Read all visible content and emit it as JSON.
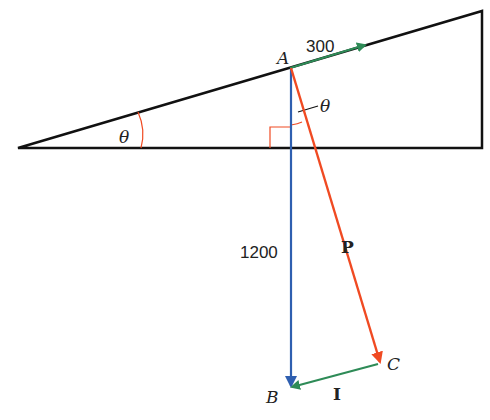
{
  "diagram": {
    "type": "vector force diagram on inclined plane",
    "angle_label": "θ",
    "points": {
      "A": "A",
      "B": "B",
      "C": "C"
    },
    "vectors": [
      {
        "name": "300",
        "from": "A",
        "direction": "up the slope",
        "color": "#2e8b57",
        "label": "300"
      },
      {
        "name": "1200",
        "from": "A",
        "to": "B",
        "direction": "vertically down",
        "color": "#2f5fb0",
        "label": "1200"
      },
      {
        "name": "P",
        "from": "A",
        "to": "C",
        "color": "#f04a22",
        "label": "P"
      },
      {
        "name": "I",
        "from": "C",
        "to": "B",
        "color": "#2e8b57",
        "label": "I"
      }
    ],
    "labels": {
      "a": "A",
      "b": "B",
      "c": "C",
      "v300": "300",
      "v1200": "1200",
      "p": "P",
      "i": "I",
      "theta_base": "θ",
      "theta_apex": "θ"
    },
    "colors": {
      "line": "#111111",
      "green": "#2e8b57",
      "blue": "#2f5fb0",
      "red": "#f04a22",
      "angle": "#f04a22"
    }
  }
}
